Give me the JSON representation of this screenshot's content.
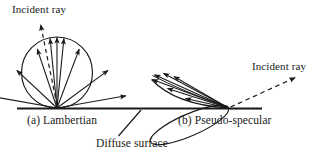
{
  "figure": {
    "background_color": "#ffffff",
    "stroke_color": "#1a1a1a",
    "width": 335,
    "height": 157,
    "labels": {
      "incident_ray_left": "Incident ray",
      "incident_ray_right": "Incident ray",
      "caption_a": "(a) Lambertian",
      "caption_b": "(b) Pseudo-specular",
      "diffuse_surface": "Diffuse surface"
    },
    "surface": {
      "name": "diffuse-surface-line",
      "x1": 17,
      "y1": 108.5,
      "x2": 262,
      "y2": 108.5,
      "stroke_width": 2.1
    },
    "lambertian": {
      "center_x": 57,
      "center_y": 72.5,
      "radius": 35.5,
      "origin_x": 57,
      "origin_y": 108,
      "ray_angles_deg": [
        10,
        32,
        56,
        78,
        90,
        102,
        124,
        148,
        170
      ],
      "incident_ray": {
        "from_x": 57,
        "from_y": 108,
        "to_x": 40,
        "to_y": 23,
        "dashed": true,
        "arrowhead": "up"
      }
    },
    "pseudo_specular": {
      "origin_x": 228.5,
      "origin_y": 108,
      "lobe_tip_x": 151,
      "lobe_tip_y": 74,
      "lobe_axis_deg": 156,
      "lobe_length": 85,
      "lobe_half_width": 11,
      "incident_ray": {
        "from_x": 228.5,
        "from_y": 108,
        "to_x": 297,
        "to_y": 76,
        "dashed": true,
        "arrowhead": "up-right"
      },
      "specular_axis_dotted": {
        "from_x": 230,
        "from_y": 108.5,
        "to_x": 262,
        "to_y": 108.5
      }
    },
    "leader_line_diffuse_surface": {
      "from_x": 141,
      "from_y": 110,
      "to_x": 118,
      "to_y": 136
    }
  }
}
